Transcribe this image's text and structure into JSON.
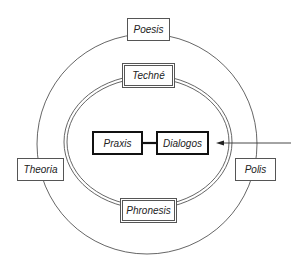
{
  "diagram": {
    "type": "concentric-circles",
    "outer_ring": {
      "labels": {
        "top": "Poesis",
        "left": "Theoria",
        "right": "Polis"
      }
    },
    "inner_ring": {
      "style": "double-line",
      "labels": {
        "top": "Techné",
        "bottom": "Phronesis"
      }
    },
    "center": {
      "nodes": [
        "Praxis",
        "Dialogos"
      ],
      "link": "Praxis — Dialogos"
    },
    "arrow": {
      "from": "right edge (outside)",
      "to": "Dialogos"
    },
    "colors": {
      "line": "#555555",
      "bold_line": "#111111",
      "text": "#222222",
      "background": "#ffffff"
    }
  }
}
